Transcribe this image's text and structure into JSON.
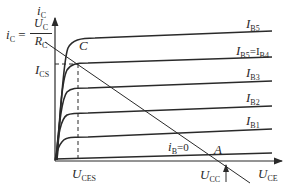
{
  "diagram": {
    "axes": {
      "y_label": {
        "main": "i",
        "sub": "C"
      },
      "x_label": {
        "main": "U",
        "sub": "CE"
      }
    },
    "curves": [
      {
        "id": "IB5",
        "label_main": "I",
        "label_sub": "B5"
      },
      {
        "id": "IB4",
        "label_main": "I",
        "label_sub": "B5",
        "label_extra": "=I",
        "label_sub2": "B4"
      },
      {
        "id": "IB3",
        "label_main": "I",
        "label_sub": "B3"
      },
      {
        "id": "IB2",
        "label_main": "I",
        "label_sub": "B2"
      },
      {
        "id": "IB1",
        "label_main": "I",
        "label_sub": "B1"
      },
      {
        "id": "IB0",
        "label_main": "i",
        "label_sub": "B",
        "label_extra": "=0"
      }
    ],
    "annotations": {
      "ic_eq": {
        "lhs_main": "i",
        "lhs_sub": "C",
        "eq": " = ",
        "num_main": "U",
        "num_sub": "C",
        "den_main": "R",
        "den_sub": "C"
      },
      "ics": {
        "main": "I",
        "sub": "CS"
      },
      "point_c": "C",
      "point_a": "A",
      "uces": {
        "main": "U",
        "sub": "CES"
      },
      "ucc": {
        "main": "U",
        "sub": "CC"
      }
    },
    "colors": {
      "line": "#2a2a2a",
      "background": "#ffffff"
    }
  }
}
